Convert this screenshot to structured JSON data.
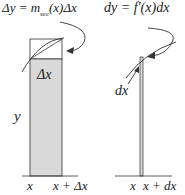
{
  "diagram": {
    "left_panel": {
      "formula": "Δy = m_sec(x)Δx",
      "formula_main": "Δy = m",
      "formula_sub": "sec",
      "formula_tail": "(x)Δx",
      "rect_label": "Δx",
      "height_label": "y",
      "x_tick_left": "x",
      "x_tick_right": "x + Δx"
    },
    "right_panel": {
      "formula": "dy = f′(x)dx",
      "width_label": "dx",
      "x_tick_left": "x",
      "x_tick_right": "x + dx"
    },
    "colors": {
      "fill": "#d9d9d9",
      "stroke": "#333333",
      "background": "#ffffff"
    }
  }
}
